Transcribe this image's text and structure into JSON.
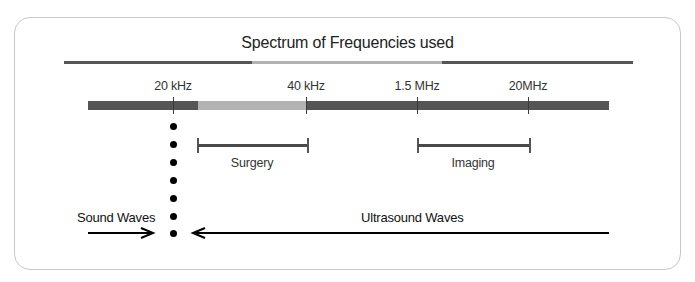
{
  "diagram": {
    "title": "Spectrum of Frequencies used",
    "colors": {
      "dark_bar": "#555555",
      "light_bar": "#b3b3b3",
      "frame_border": "#c8c8c8",
      "dot": "#000000",
      "arrow": "#000000"
    },
    "top_bar": {
      "segments": [
        {
          "start_x": 64,
          "end_x": 252,
          "shade": "dark"
        },
        {
          "start_x": 252,
          "end_x": 442,
          "shade": "light"
        },
        {
          "start_x": 442,
          "end_x": 633,
          "shade": "dark"
        }
      ]
    },
    "frequency_axis": {
      "segments": [
        {
          "start_x": 88,
          "end_x": 198,
          "shade": "dark"
        },
        {
          "start_x": 198,
          "end_x": 306,
          "shade": "light"
        },
        {
          "start_x": 306,
          "end_x": 609,
          "shade": "dark"
        }
      ],
      "ticks": [
        {
          "label": "20 kHz",
          "x": 173
        },
        {
          "label": "40 kHz",
          "x": 306
        },
        {
          "label": "1.5 MHz",
          "x": 417
        },
        {
          "label": "20MHz",
          "x": 528
        }
      ]
    },
    "ranges": [
      {
        "label": "Surgery",
        "from": "20 kHz",
        "to": "40 kHz"
      },
      {
        "label": "Imaging",
        "from": "1.5 MHz",
        "to": "20MHz"
      }
    ],
    "boundary": {
      "at": "20 kHz",
      "dot_count": 7
    },
    "waves": [
      {
        "label": "Sound Waves",
        "direction": "right"
      },
      {
        "label": "Ultrasound Waves",
        "direction": "left"
      }
    ]
  }
}
